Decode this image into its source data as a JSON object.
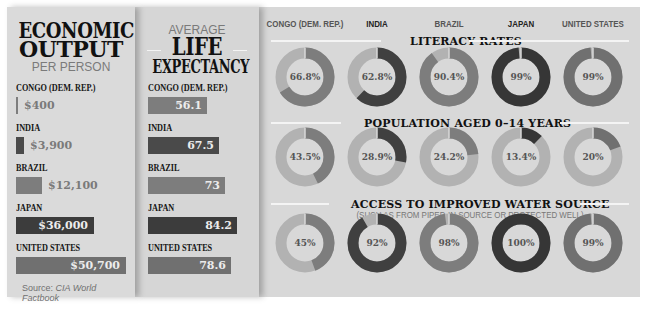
{
  "economic_output": {
    "title_line1": "ECONOMIC",
    "title_line2": "OUTPUT",
    "subtitle": "PER PERSON",
    "unit": "USD per person",
    "max": 50700,
    "rows": [
      {
        "country": "CONGO (DEM. REP.)",
        "value": 400,
        "label": "$400",
        "color": "#7d7d7d"
      },
      {
        "country": "INDIA",
        "value": 3900,
        "label": "$3,900",
        "color": "#4a4a4a"
      },
      {
        "country": "BRAZIL",
        "value": 12100,
        "label": "$12,100",
        "color": "#7d7d7d"
      },
      {
        "country": "JAPAN",
        "value": 36000,
        "label": "$36,000",
        "color": "#3c3c3c"
      },
      {
        "country": "UNITED STATES",
        "value": 50700,
        "label": "$50,700",
        "color": "#707070"
      }
    ]
  },
  "life_expectancy": {
    "kicker": "AVERAGE",
    "title_line1": "LIFE",
    "title_line2": "EXPECTANCY",
    "unit": "years",
    "max": 84.2,
    "rows": [
      {
        "country": "CONGO (DEM. REP.)",
        "value": 56.1,
        "label": "56.1",
        "color": "#7d7d7d"
      },
      {
        "country": "INDIA",
        "value": 67.5,
        "label": "67.5",
        "color": "#4a4a4a"
      },
      {
        "country": "BRAZIL",
        "value": 73,
        "label": "73",
        "color": "#7d7d7d"
      },
      {
        "country": "JAPAN",
        "value": 84.2,
        "label": "84.2",
        "color": "#3c3c3c"
      },
      {
        "country": "UNITED STATES",
        "value": 78.6,
        "label": "78.6",
        "color": "#707070"
      }
    ]
  },
  "source": {
    "prefix": "Source: ",
    "name": "CIA World Factbook"
  },
  "rings": {
    "countries": [
      {
        "name": "CONGO (DEM. REP.)",
        "color": "#7d7d7d",
        "emphasis": false
      },
      {
        "name": "INDIA",
        "color": "#404040",
        "emphasis": true
      },
      {
        "name": "BRAZIL",
        "color": "#7d7d7d",
        "emphasis": false
      },
      {
        "name": "JAPAN",
        "color": "#363636",
        "emphasis": true
      },
      {
        "name": "UNITED STATES",
        "color": "#707070",
        "emphasis": false
      }
    ],
    "track_color": "#b2b2b2",
    "sections": [
      {
        "title": "LITERACY RATES",
        "subtitle": "",
        "values": [
          66.8,
          62.8,
          90.4,
          99,
          99
        ],
        "labels": [
          "66.8%",
          "62.8%",
          "90.4%",
          "99%",
          "99%"
        ]
      },
      {
        "title": "POPULATION AGED 0–14 YEARS",
        "subtitle": "",
        "values": [
          43.5,
          28.9,
          24.2,
          13.4,
          20
        ],
        "labels": [
          "43.5%",
          "28.9%",
          "24.2%",
          "13.4%",
          "20%"
        ]
      },
      {
        "title": "ACCESS TO IMPROVED WATER SOURCE",
        "subtitle": "(SUCH AS FROM PIPED-IN SOURCE OR PROTECTED WELL)",
        "values": [
          45,
          92,
          98,
          100,
          99
        ],
        "labels": [
          "45%",
          "92%",
          "98%",
          "100%",
          "99%"
        ]
      }
    ]
  },
  "chart_data": [
    {
      "type": "bar",
      "title": "ECONOMIC OUTPUT PER PERSON",
      "orientation": "horizontal",
      "categories": [
        "CONGO (DEM. REP.)",
        "INDIA",
        "BRAZIL",
        "JAPAN",
        "UNITED STATES"
      ],
      "values": [
        400,
        3900,
        12100,
        36000,
        50700
      ],
      "data_labels": [
        "$400",
        "$3,900",
        "$12,100",
        "$36,000",
        "$50,700"
      ],
      "xlabel": "",
      "ylabel": "",
      "grid": false
    },
    {
      "type": "bar",
      "title": "AVERAGE LIFE EXPECTANCY",
      "orientation": "horizontal",
      "categories": [
        "CONGO (DEM. REP.)",
        "INDIA",
        "BRAZIL",
        "JAPAN",
        "UNITED STATES"
      ],
      "values": [
        56.1,
        67.5,
        73,
        84.2,
        78.6
      ],
      "data_labels": [
        "56.1",
        "67.5",
        "73",
        "84.2",
        "78.6"
      ],
      "xlabel": "",
      "ylabel": "",
      "grid": false
    },
    {
      "type": "pie",
      "subtype": "donut",
      "title": "LITERACY RATES",
      "categories": [
        "CONGO (DEM. REP.)",
        "INDIA",
        "BRAZIL",
        "JAPAN",
        "UNITED STATES"
      ],
      "values": [
        66.8,
        62.8,
        90.4,
        99,
        99
      ],
      "unit": "%"
    },
    {
      "type": "pie",
      "subtype": "donut",
      "title": "POPULATION AGED 0–14 YEARS",
      "categories": [
        "CONGO (DEM. REP.)",
        "INDIA",
        "BRAZIL",
        "JAPAN",
        "UNITED STATES"
      ],
      "values": [
        43.5,
        28.9,
        24.2,
        13.4,
        20
      ],
      "unit": "%"
    },
    {
      "type": "pie",
      "subtype": "donut",
      "title": "ACCESS TO IMPROVED WATER SOURCE",
      "subtitle": "(SUCH AS FROM PIPED-IN SOURCE OR PROTECTED WELL)",
      "categories": [
        "CONGO (DEM. REP.)",
        "INDIA",
        "BRAZIL",
        "JAPAN",
        "UNITED STATES"
      ],
      "values": [
        45,
        92,
        98,
        100,
        99
      ],
      "unit": "%"
    }
  ]
}
